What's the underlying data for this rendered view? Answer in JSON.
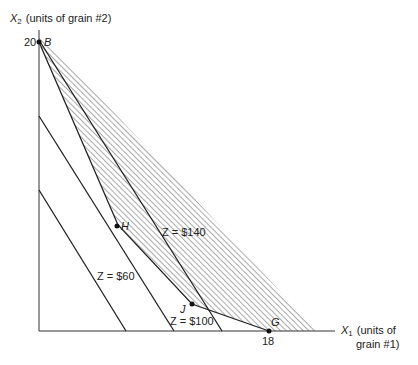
{
  "diagram": {
    "type": "linear-programming-feasible-region",
    "y_axis": {
      "symbol": "X",
      "subscript": "2",
      "label": "(units of grain #2)",
      "tick_value": "20"
    },
    "x_axis": {
      "symbol": "X",
      "subscript": "1",
      "label_line1": "(units of",
      "label_line2": "grain #1)",
      "tick_value": "18"
    },
    "points": [
      {
        "name": "B",
        "label": "B"
      },
      {
        "name": "H",
        "label": "H"
      },
      {
        "name": "J",
        "label": "J"
      },
      {
        "name": "G",
        "label": "G"
      }
    ],
    "iso_cost_lines": [
      {
        "z": "Z = $60"
      },
      {
        "z": "Z = $100"
      },
      {
        "z": "Z = $140"
      }
    ],
    "colors": {
      "line": "#222222",
      "hatch": "#555555",
      "background": "#ffffff"
    }
  }
}
